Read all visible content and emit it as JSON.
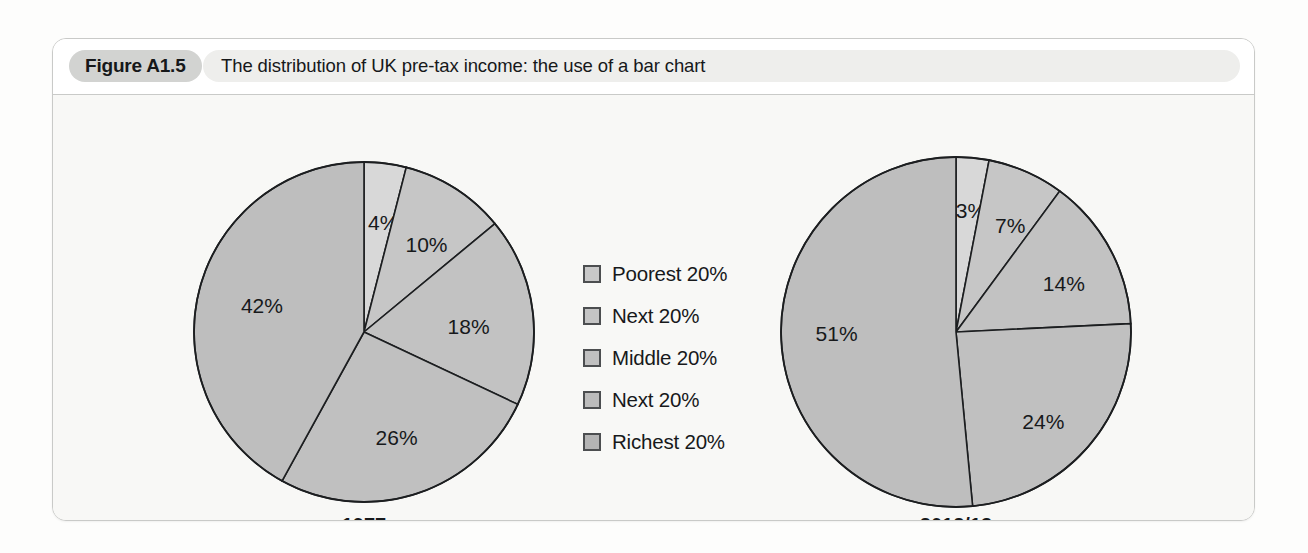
{
  "figure": {
    "badge_label": "Figure A1.5",
    "caption": "The distribution of UK pre-tax income: the use of a bar chart"
  },
  "legend": {
    "items": [
      {
        "label": "Poorest 20%",
        "color": "#c8c8c8"
      },
      {
        "label": "Next 20%",
        "color": "#c4c4c4"
      },
      {
        "label": "Middle 20%",
        "color": "#c0c0c0"
      },
      {
        "label": "Next 20%",
        "color": "#bcbcbc"
      },
      {
        "label": "Richest 20%",
        "color": "#b4b4b4"
      }
    ]
  },
  "chart_data": [
    {
      "type": "pie",
      "title": "1977",
      "categories": [
        "Poorest 20%",
        "Next 20%",
        "Middle 20%",
        "Next 20%",
        "Richest 20%"
      ],
      "values": [
        4,
        10,
        18,
        26,
        42
      ],
      "labels": [
        "4%",
        "10%",
        "18%",
        "26%",
        "42%"
      ],
      "colors": [
        "#d8d8d8",
        "#c6c6c6",
        "#c2c2c2",
        "#c0c0c0",
        "#bebebe"
      ],
      "legend_position": "center",
      "start_angle_deg": 0,
      "direction": "clockwise"
    },
    {
      "type": "pie",
      "title": "2012/13",
      "categories": [
        "Poorest 20%",
        "Next 20%",
        "Middle 20%",
        "Next 20%",
        "Richest 20%"
      ],
      "values": [
        3,
        7,
        14,
        24,
        51
      ],
      "labels": [
        "3%",
        "7%",
        "14%",
        "24%",
        "51%"
      ],
      "colors": [
        "#d8d8d8",
        "#c6c6c6",
        "#c2c2c2",
        "#c0c0c0",
        "#bebebe"
      ],
      "legend_position": "center",
      "start_angle_deg": 0,
      "direction": "clockwise"
    }
  ],
  "geometry": {
    "pies": [
      {
        "cx": 311,
        "cy": 237,
        "r": 170,
        "label_y": 437,
        "label_radius_factor": 0.62
      },
      {
        "cx": 903,
        "cy": 237,
        "r": 175,
        "label_y": 437,
        "label_radius_factor": 0.66
      }
    ],
    "label_offsets": [
      [
        {
          "dx": 6,
          "dy": -4
        },
        {
          "dx": 6,
          "dy": 2
        },
        {
          "dx": 0,
          "dy": 8
        },
        {
          "dx": 0,
          "dy": 6
        },
        {
          "dx": 0,
          "dy": 0
        }
      ],
      [
        {
          "dx": 4,
          "dy": -6
        },
        {
          "dx": 8,
          "dy": 0
        },
        {
          "dx": 6,
          "dy": 6
        },
        {
          "dx": 0,
          "dy": 14
        },
        {
          "dx": -4,
          "dy": -4
        }
      ]
    ]
  },
  "colors": {
    "frame_border": "#c9cac8",
    "header_bg": "#ffffff",
    "body_bg": "#f8f8f6",
    "badge_bg": "#d2d3d1",
    "caption_bg": "#eeeeec",
    "pie_stroke": "#1c1e20",
    "text": "#17191b"
  }
}
